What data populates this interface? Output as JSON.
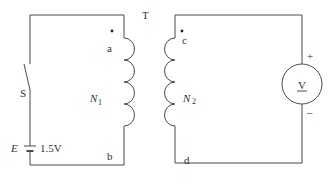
{
  "diagram": {
    "type": "transformer-circuit",
    "transformer": {
      "label": "T"
    },
    "primary": {
      "winding_label": "N",
      "winding_subscript": "1",
      "terminal_top": "a",
      "terminal_bottom": "b",
      "switch_label": "S",
      "source_label": "E",
      "source_value": "1.5V"
    },
    "secondary": {
      "winding_label": "N",
      "winding_subscript": "2",
      "terminal_top": "c",
      "terminal_bottom": "d",
      "meter_label": "V",
      "meter_plus": "+",
      "meter_minus": "–"
    },
    "colors": {
      "line": "#4a4a4a",
      "text": "#333333",
      "background": "#ffffff"
    }
  }
}
